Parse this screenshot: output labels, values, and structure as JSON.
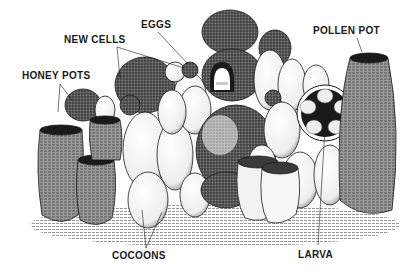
{
  "figure": {
    "labels": {
      "eggs": "EGGS",
      "new_cells": "NEW CELLS",
      "honey_pots": "HONEY POTS",
      "pollen_pot": "POLLEN POT",
      "cocoons": "COCOONS",
      "larva": "LARVA"
    },
    "colors": {
      "ink": "#1a1a1a",
      "paper": "#ffffff",
      "shade_dark": "#3a3a3a",
      "shade_mid": "#8a8a8a",
      "shade_light": "#d8d8d8"
    }
  }
}
